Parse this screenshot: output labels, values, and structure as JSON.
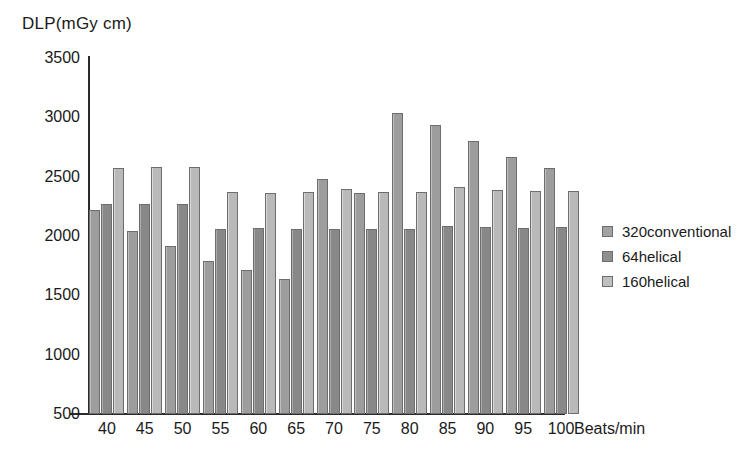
{
  "chart_data": {
    "type": "bar",
    "title": "",
    "ylabel": "DLP(mGy cm)",
    "xlabel": "Beats/min",
    "categories": [
      "40",
      "45",
      "50",
      "55",
      "60",
      "65",
      "70",
      "75",
      "80",
      "85",
      "90",
      "95",
      "100"
    ],
    "ylim": [
      500,
      3500
    ],
    "yticks": [
      "3500",
      "3000",
      "2500",
      "2000",
      "1500",
      "1000",
      "500"
    ],
    "grid": false,
    "legend_position": "right",
    "series": [
      {
        "name": "320conventional",
        "color": "#a3a3a3",
        "values": [
          2220,
          2040,
          1920,
          1790,
          1710,
          1640,
          2480,
          2360,
          3040,
          2935,
          2800,
          2670,
          2570
        ]
      },
      {
        "name": "64helical",
        "color": "#8f8f8f",
        "values": [
          2270,
          2270,
          2270,
          2060,
          2070,
          2060,
          2060,
          2060,
          2060,
          2085,
          2075,
          2070,
          2075
        ]
      },
      {
        "name": "160helical",
        "color": "#bfbfbf",
        "values": [
          2570,
          2580,
          2580,
          2375,
          2365,
          2370,
          2395,
          2375,
          2375,
          2410,
          2385,
          2380,
          2380
        ]
      }
    ]
  },
  "legend": {
    "items": [
      {
        "label": "320conventional"
      },
      {
        "label": "64helical"
      },
      {
        "label": "160helical"
      }
    ]
  }
}
